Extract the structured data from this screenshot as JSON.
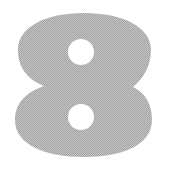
{
  "figure": {
    "glyph": "8",
    "alt": "Large halftone gray numeral 8 on a white background",
    "colors": {
      "background": "#ffffff",
      "halftone_dark": "#a3a3a3",
      "halftone_light": "#c5c5c5",
      "average_gray": "#b4b4b4",
      "counter_white": "#ffffff"
    }
  }
}
